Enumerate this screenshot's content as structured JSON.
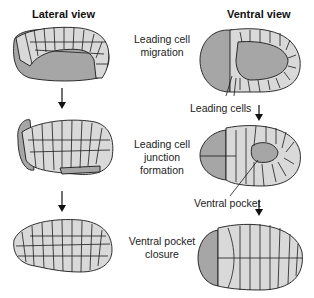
{
  "headers": {
    "lateral": "Lateral view",
    "ventral": "Ventral view"
  },
  "stages": [
    {
      "lines": [
        "Leading cell",
        "migration"
      ]
    },
    {
      "lines": [
        "Leading cell",
        "junction",
        "formation"
      ]
    },
    {
      "lines": [
        "Ventral pocket",
        "closure"
      ]
    }
  ],
  "callouts": {
    "leading_cells": "Leading cells",
    "ventral_pocket": "Ventral pocket"
  },
  "arrows": {
    "glyph": "↓"
  },
  "colors": {
    "cell_fill": "#d9d9d9",
    "yolk_fill": "#a6a6a6",
    "outline": "#1a1a1a"
  }
}
